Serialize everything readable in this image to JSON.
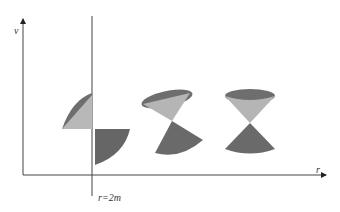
{
  "diagram": {
    "axes": {
      "vertical_label": "v",
      "horizontal_label": "r"
    },
    "horizon_label": "r=2m",
    "light_cones": [
      {
        "name": "cone-at-horizon",
        "tilt": "45deg"
      },
      {
        "name": "cone-intermediate",
        "tilt": "partial"
      },
      {
        "name": "cone-far",
        "tilt": "upright"
      }
    ],
    "colors": {
      "dark_cone": "#6b6b6b",
      "light_cone": "#b5b5b5",
      "axis": "#333333"
    }
  }
}
